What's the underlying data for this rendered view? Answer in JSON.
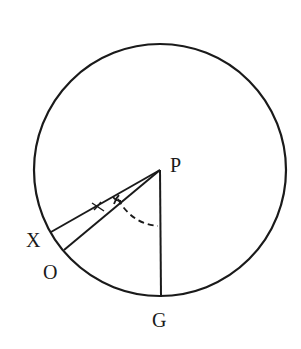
{
  "diagram": {
    "type": "geometry",
    "points": {
      "P": {
        "label": "P"
      },
      "X": {
        "label": "X"
      },
      "O": {
        "label": "O"
      },
      "G": {
        "label": "G"
      }
    },
    "segments": [
      "PX",
      "PO",
      "PG"
    ],
    "angle_marks": [
      "angle X-P-O marked with small arc ticks",
      "angle O-P-G dashed arc"
    ],
    "colors": {
      "stroke": "#1a1a1a",
      "background": "#ffffff"
    }
  }
}
